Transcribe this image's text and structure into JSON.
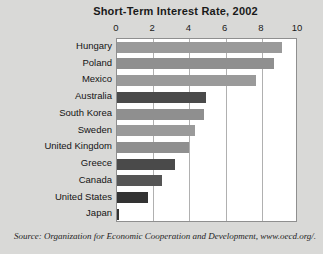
{
  "chart_data": {
    "type": "bar",
    "orientation": "horizontal",
    "title": "Short-Term Interest Rate, 2002",
    "xlabel": "",
    "ylabel": "",
    "xlim": [
      0,
      10
    ],
    "xticks": [
      0,
      2,
      4,
      6,
      8,
      10
    ],
    "xtick_labels": [
      "0",
      "2",
      "4",
      "6",
      "8",
      "10"
    ],
    "grid": true,
    "legend": null,
    "categories": [
      "Hungary",
      "Poland",
      "Mexico",
      "Australia",
      "South Korea",
      "Sweden",
      "United Kingdom",
      "Greece",
      "Canada",
      "United States",
      "Japan"
    ],
    "values": [
      9.1,
      8.7,
      7.7,
      4.9,
      4.8,
      4.3,
      4.0,
      3.2,
      2.5,
      1.7,
      0.1
    ],
    "bar_colors": [
      "#9a9a9a",
      "#8f8f8f",
      "#9a9a9a",
      "#4a4a4a",
      "#8f8f8f",
      "#9a9a9a",
      "#8f8f8f",
      "#4a4a4a",
      "#555555",
      "#333333",
      "#333333"
    ]
  },
  "source": {
    "text": "Source: Organization for Economic Cooperation and Development, www.oecd.org/."
  },
  "colors": {
    "background": "#d9d9d7",
    "plot_background": "#ffffff",
    "gridline": "#b0b0b0",
    "frame": "#8f8f8f",
    "text": "#1a1a1a"
  }
}
